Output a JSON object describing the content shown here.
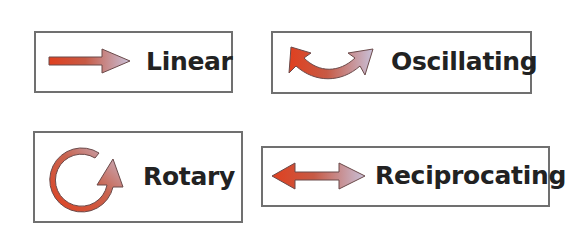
{
  "diagram": {
    "type": "motion-types",
    "colors": {
      "arrow_start": "#e0401f",
      "arrow_end": "#c8c0d8",
      "arrow_outline": "#6b4a4a",
      "label_text": "#222222",
      "card_border": "#707070",
      "background": "#ffffff"
    },
    "cards": [
      {
        "id": "linear",
        "label": "Linear",
        "icon": "right-arrow-icon"
      },
      {
        "id": "oscillating",
        "label": "Oscillating",
        "icon": "curved-double-arrow-icon"
      },
      {
        "id": "rotary",
        "label": "Rotary",
        "icon": "circular-arrow-icon"
      },
      {
        "id": "reciprocating",
        "label": "Reciprocating",
        "icon": "left-right-arrow-icon"
      }
    ]
  }
}
